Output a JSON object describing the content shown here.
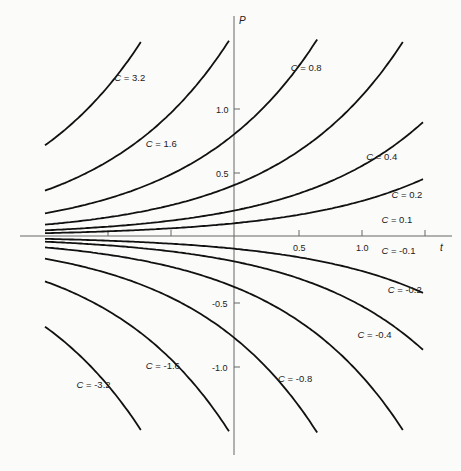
{
  "chart_data": {
    "type": "line",
    "title": "",
    "xlabel": "t",
    "ylabel": "P",
    "function": "P = C e^t",
    "xlim": [
      -1.5,
      1.5
    ],
    "ylim": [
      -1.55,
      1.55
    ],
    "grid": false,
    "legend": "inline labels",
    "x_ticks": [
      -1.0,
      -0.5,
      0.5,
      1.0,
      1.5
    ],
    "x_tick_labels": [
      "",
      "",
      "0.5",
      "1.0",
      ""
    ],
    "y_ticks": [
      -1.0,
      -0.5,
      0.5,
      1.0
    ],
    "y_tick_labels": [
      "-1.0",
      "-0.5",
      "0.5",
      "1.0"
    ],
    "series": [
      {
        "name": "C = 3.2",
        "C": 3.2,
        "label_at": [
          -0.95,
          1.22
        ]
      },
      {
        "name": "C = 1.6",
        "C": 1.6,
        "label_at": [
          -0.7,
          0.7
        ]
      },
      {
        "name": "C = 0.8",
        "C": 0.8,
        "label_at": [
          0.45,
          1.3
        ]
      },
      {
        "name": "C = 0.4",
        "C": 0.4,
        "label_at": [
          1.05,
          0.6
        ]
      },
      {
        "name": "C = 0.2",
        "C": 0.2,
        "label_at": [
          1.25,
          0.3
        ]
      },
      {
        "name": "C = 0.1",
        "C": 0.1,
        "label_at": [
          1.17,
          0.1
        ]
      },
      {
        "name": "C = -0.1",
        "C": -0.1,
        "label_at": [
          1.17,
          -0.14
        ]
      },
      {
        "name": "C = -0.2",
        "C": -0.2,
        "label_at": [
          1.22,
          -0.45
        ]
      },
      {
        "name": "C = -0.4",
        "C": -0.4,
        "label_at": [
          0.98,
          -0.8
        ]
      },
      {
        "name": "C = -0.8",
        "C": -0.8,
        "label_at": [
          0.35,
          -1.15
        ]
      },
      {
        "name": "C = -1.6",
        "C": -1.6,
        "label_at": [
          -0.7,
          -1.05
        ]
      },
      {
        "name": "C = -3.2",
        "C": -3.2,
        "label_at": [
          -1.25,
          -1.2
        ]
      }
    ]
  },
  "axis_labels": {
    "x": "t",
    "y": "P"
  },
  "tick_labels": {
    "x_05": "0.5",
    "x_10": "1.0",
    "y_10": "1.0",
    "y_05": "0.5",
    "y_m05": "-0.5",
    "y_m10": "-1.0"
  }
}
